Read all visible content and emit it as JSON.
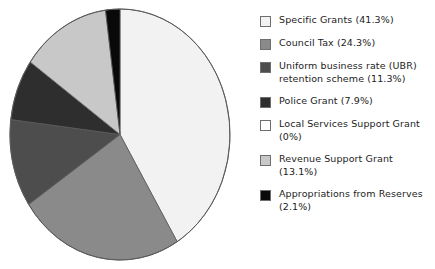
{
  "chart_data": {
    "type": "pie",
    "title": "",
    "subtitle": "",
    "xlabel": "",
    "ylabel": "",
    "legend_position": "right",
    "grid": false,
    "start_angle_deg": 0,
    "direction": "clockwise",
    "categories": [
      "Specific Grants",
      "Council Tax",
      "Uniform business rate (UBR) retention scheme",
      "Police Grant",
      "Local Services Support Grant",
      "Revenue Support Grant",
      "Appropriations from Reserves"
    ],
    "values": [
      41.3,
      24.3,
      11.3,
      7.9,
      0,
      13.1,
      2.1
    ],
    "value_unit": "%",
    "colors": [
      "#f2f2f2",
      "#8a8a8a",
      "#4d4d4d",
      "#2e2e2e",
      "#ffffff",
      "#c8c8c8",
      "#090909"
    ],
    "slices": [
      {
        "label": "Specific Grants",
        "value": 41.3,
        "display": "41.3%",
        "color": "#f2f2f2"
      },
      {
        "label": "Council Tax",
        "value": 24.3,
        "display": "24.3%",
        "color": "#8a8a8a"
      },
      {
        "label": "Uniform business rate (UBR) retention scheme",
        "value": 11.3,
        "display": "11.3%",
        "color": "#4d4d4d"
      },
      {
        "label": "Police Grant",
        "value": 7.9,
        "display": "7.9%",
        "color": "#2e2e2e"
      },
      {
        "label": "Local Services Support Grant",
        "value": 0,
        "display": "0%",
        "color": "#ffffff"
      },
      {
        "label": "Revenue Support Grant",
        "value": 13.1,
        "display": "13.1%",
        "color": "#c8c8c8"
      },
      {
        "label": "Appropriations from Reserves",
        "value": 2.1,
        "display": "2.1%",
        "color": "#090909"
      }
    ]
  },
  "legend": {
    "items": [
      {
        "text": "Specific Grants (41.3%)",
        "swatch": "legend-swatch-specific-grants",
        "color": "#f2f2f2"
      },
      {
        "text": "Council Tax (24.3%)",
        "swatch": "legend-swatch-council-tax",
        "color": "#8a8a8a"
      },
      {
        "text": "Uniform business rate (UBR)\nretention scheme (11.3%)",
        "swatch": "legend-swatch-ubr",
        "color": "#4d4d4d"
      },
      {
        "text": "Police Grant (7.9%)",
        "swatch": "legend-swatch-police-grant",
        "color": "#2e2e2e"
      },
      {
        "text": "Local Services Support Grant\n(0%)",
        "swatch": "legend-swatch-local-services",
        "color": "#ffffff"
      },
      {
        "text": "Revenue Support Grant\n(13.1%)",
        "swatch": "legend-swatch-revenue-support",
        "color": "#c8c8c8"
      },
      {
        "text": "Appropriations from Reserves\n(2.1%)",
        "swatch": "legend-swatch-appropriations",
        "color": "#090909"
      }
    ]
  },
  "style": {
    "pie_outline": "#5a5a5a",
    "background": "#ffffff",
    "text_color": "#1c1c1c"
  }
}
